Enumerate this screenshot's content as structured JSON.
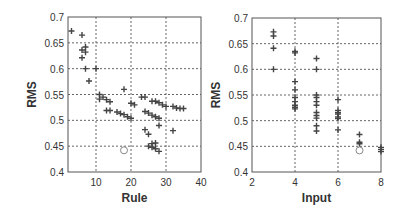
{
  "chart_data": [
    {
      "type": "scatter",
      "title": "",
      "xlabel": "Rule",
      "ylabel": "RMS",
      "xlim": [
        2,
        40
      ],
      "ylim": [
        0.4,
        0.7
      ],
      "xticks": [
        10,
        20,
        30,
        40
      ],
      "yticks": [
        0.4,
        0.45,
        0.5,
        0.55,
        0.6,
        0.65,
        0.7
      ],
      "ytick_labels": [
        "0.4",
        "0.45",
        "0.5",
        "0.55",
        "0.6",
        "0.65",
        "0.7"
      ],
      "grid": true,
      "series": [
        {
          "name": "candidates",
          "marker": "+",
          "points": [
            [
              3,
              0.673
            ],
            [
              6,
              0.665
            ],
            [
              6,
              0.636
            ],
            [
              7,
              0.642
            ],
            [
              7,
              0.632
            ],
            [
              6,
              0.621
            ],
            [
              7,
              0.6
            ],
            [
              10,
              0.6
            ],
            [
              8,
              0.576
            ],
            [
              11,
              0.55
            ],
            [
              12,
              0.545
            ],
            [
              11,
              0.541
            ],
            [
              13,
              0.54
            ],
            [
              14,
              0.536
            ],
            [
              13,
              0.519
            ],
            [
              14,
              0.519
            ],
            [
              16,
              0.516
            ],
            [
              17,
              0.513
            ],
            [
              18,
              0.511
            ],
            [
              19,
              0.507
            ],
            [
              20,
              0.504
            ],
            [
              18,
              0.56
            ],
            [
              20,
              0.533
            ],
            [
              21,
              0.53
            ],
            [
              23,
              0.545
            ],
            [
              24,
              0.545
            ],
            [
              24,
              0.517
            ],
            [
              25,
              0.514
            ],
            [
              26,
              0.51
            ],
            [
              27,
              0.507
            ],
            [
              28,
              0.504
            ],
            [
              26,
              0.537
            ],
            [
              27,
              0.537
            ],
            [
              28,
              0.534
            ],
            [
              29,
              0.53
            ],
            [
              30,
              0.527
            ],
            [
              32,
              0.527
            ],
            [
              33,
              0.524
            ],
            [
              34,
              0.523
            ],
            [
              35,
              0.523
            ],
            [
              24,
              0.482
            ],
            [
              25,
              0.473
            ],
            [
              28,
              0.49
            ],
            [
              32,
              0.48
            ],
            [
              25,
              0.45
            ],
            [
              26,
              0.455
            ],
            [
              27,
              0.456
            ],
            [
              26,
              0.448
            ],
            [
              27,
              0.445
            ],
            [
              28,
              0.44
            ]
          ]
        },
        {
          "name": "selected",
          "marker": "o",
          "points": [
            [
              18,
              0.442
            ]
          ]
        }
      ]
    },
    {
      "type": "scatter",
      "title": "",
      "xlabel": "Input",
      "ylabel": "RMS",
      "xlim": [
        2,
        8
      ],
      "ylim": [
        0.4,
        0.7
      ],
      "xticks": [
        2,
        4,
        6,
        8
      ],
      "yticks": [
        0.4,
        0.45,
        0.5,
        0.55,
        0.6,
        0.65,
        0.7
      ],
      "ytick_labels": [
        "0.4",
        "0.45",
        "0.5",
        "0.55",
        "0.6",
        "0.65",
        "0.7"
      ],
      "grid": true,
      "series": [
        {
          "name": "candidates",
          "marker": "+",
          "points": [
            [
              3,
              0.673
            ],
            [
              3,
              0.665
            ],
            [
              3,
              0.641
            ],
            [
              3,
              0.6
            ],
            [
              4,
              0.635
            ],
            [
              4,
              0.632
            ],
            [
              4,
              0.576
            ],
            [
              4,
              0.56
            ],
            [
              4,
              0.545
            ],
            [
              4,
              0.537
            ],
            [
              4,
              0.53
            ],
            [
              4,
              0.526
            ],
            [
              4,
              0.523
            ],
            [
              5,
              0.621
            ],
            [
              5,
              0.6
            ],
            [
              5,
              0.55
            ],
            [
              5,
              0.545
            ],
            [
              5,
              0.537
            ],
            [
              5,
              0.53
            ],
            [
              5,
              0.516
            ],
            [
              5,
              0.51
            ],
            [
              5,
              0.505
            ],
            [
              5,
              0.49
            ],
            [
              5,
              0.48
            ],
            [
              6,
              0.541
            ],
            [
              6,
              0.52
            ],
            [
              6,
              0.516
            ],
            [
              6,
              0.513
            ],
            [
              6,
              0.507
            ],
            [
              6,
              0.504
            ],
            [
              6,
              0.482
            ],
            [
              7,
              0.473
            ],
            [
              7,
              0.458
            ],
            [
              7,
              0.455
            ],
            [
              8,
              0.448
            ],
            [
              8,
              0.444
            ],
            [
              8,
              0.44
            ]
          ]
        },
        {
          "name": "selected",
          "marker": "o",
          "points": [
            [
              7,
              0.442
            ]
          ]
        }
      ]
    }
  ],
  "panels": [
    {
      "box": {
        "x0": 68,
        "y0": 17,
        "x1": 201,
        "y1": 172
      }
    },
    {
      "box": {
        "x0": 252,
        "y0": 18,
        "x1": 381,
        "y1": 172
      }
    }
  ],
  "colors": {
    "axis": "#555555",
    "grid": "#666666",
    "marker": "#444444",
    "selected": "#888888"
  }
}
